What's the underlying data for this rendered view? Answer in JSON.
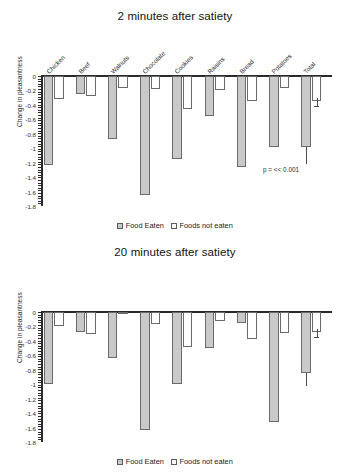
{
  "figure": {
    "panels": [
      {
        "id": "panel-2min",
        "annotation": "p = << 0.001",
        "legend": [
          {
            "key": "eaten",
            "label": "Food Eaten"
          },
          {
            "key": "noteaten",
            "label": "Foods not eaten"
          }
        ],
        "chart_data": {
          "type": "bar",
          "title": "2 minutes after satiety",
          "xlabel": "",
          "ylabel": "Change in pleasantness",
          "ylim": [
            -1.8,
            0
          ],
          "yticks": [
            "0",
            "-0.2",
            "-0.4",
            "-0.6",
            "-0.8",
            "-1",
            "-1.2",
            "-1.4",
            "-1.6",
            "-1.8"
          ],
          "ytick_values": [
            0,
            -0.2,
            -0.4,
            -0.6,
            -0.8,
            -1,
            -1.2,
            -1.4,
            -1.6,
            -1.8
          ],
          "grid": false,
          "legend_position": "bottom",
          "categories": [
            "Chicken",
            "Beef",
            "Walnuts",
            "Chocolate",
            "Cookies",
            "Raisins",
            "Bread",
            "Potatoes",
            "Total"
          ],
          "series": [
            {
              "name": "Food Eaten",
              "color": "#c9c9c9",
              "values": [
                -1.23,
                -0.25,
                -0.87,
                -1.65,
                -1.15,
                -0.55,
                -1.26,
                -0.98,
                -0.98
              ]
            },
            {
              "name": "Foods not eaten",
              "color": "#ffffff",
              "values": [
                -0.32,
                -0.28,
                -0.16,
                -0.18,
                -0.45,
                -0.2,
                -0.34,
                -0.16,
                -0.35
              ]
            }
          ],
          "error_bars": [
            {
              "category": "Total",
              "series": "Foods not eaten",
              "value": -0.35,
              "low": -0.42,
              "high": -0.3
            },
            {
              "category": "Total",
              "series": "Food Eaten",
              "value": -0.98,
              "low": -1.22,
              "high": -0.98
            }
          ],
          "annotations": [
            {
              "text": "p = << 0.001",
              "x": "Total",
              "y": -1.25
            }
          ]
        }
      },
      {
        "id": "panel-20min",
        "annotation": "p = << 0.001",
        "legend": [
          {
            "key": "eaten",
            "label": "Food Eaten"
          },
          {
            "key": "noteaten",
            "label": "Foods not eaten"
          }
        ],
        "chart_data": {
          "type": "bar",
          "title": "20 minutes after satiety",
          "xlabel": "",
          "ylabel": "Change in pleasantness",
          "ylim": [
            -1.8,
            0
          ],
          "yticks": [
            "0",
            "-0.2",
            "-0.4",
            "-0.6",
            "-0.8",
            "-1",
            "-1.2",
            "-1.4",
            "-1.6",
            "-1.8"
          ],
          "ytick_values": [
            0,
            -0.2,
            -0.4,
            -0.6,
            -0.8,
            -1,
            -1.2,
            -1.4,
            -1.6,
            -1.8
          ],
          "grid": false,
          "legend_position": "bottom",
          "categories": [
            "Chicken",
            "Beef",
            "Walnuts",
            "Chocolate",
            "Cookies",
            "Raisins",
            "Bread",
            "Potatoes",
            "Total"
          ],
          "series": [
            {
              "name": "Food Eaten",
              "color": "#c9c9c9",
              "values": [
                -1.0,
                -0.27,
                -0.63,
                -1.64,
                -1.0,
                -0.5,
                -0.15,
                -1.52,
                -0.84
              ]
            },
            {
              "name": "Foods not eaten",
              "color": "#ffffff",
              "values": [
                -0.19,
                -0.31,
                -0.01,
                -0.16,
                -0.49,
                -0.12,
                -0.37,
                -0.29,
                -0.28
              ]
            }
          ],
          "error_bars": [
            {
              "category": "Total",
              "series": "Foods not eaten",
              "value": -0.28,
              "low": -0.34,
              "high": -0.24
            },
            {
              "category": "Total",
              "series": "Food Eaten",
              "value": -0.84,
              "low": -1.02,
              "high": -0.84
            }
          ],
          "annotations": [
            {
              "text": "p = << 0.001",
              "x": "Total",
              "y": -1.08
            }
          ]
        }
      }
    ]
  }
}
